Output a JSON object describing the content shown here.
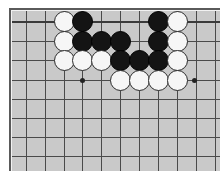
{
  "figure": {
    "kind": "go-board-diagram",
    "width": 220,
    "height": 171
  },
  "colors": {
    "page_background": "#ffffff",
    "board_background": "#c9c9c9",
    "board_frame": "#5a5a5a",
    "grid_line": "#4a4a4a",
    "edge_line": "#3a3a3a",
    "black_stone": "#141414",
    "white_stone": "#f6f6f6",
    "stone_outline": "#2b2b2b",
    "star_point": "#222222"
  },
  "board": {
    "origin_x": 12,
    "origin_y": 11,
    "cell_size": 19.3,
    "surface_width": 208,
    "surface_height": 160,
    "columns": 11,
    "rows": 8,
    "top_edge_visible": true,
    "left_edge_visible": true,
    "column_x": [
      14,
      33,
      52,
      70,
      89,
      108,
      127,
      146,
      165,
      184,
      203
    ],
    "row_y": [
      10,
      30,
      49,
      69,
      88,
      107,
      126,
      145
    ],
    "edge_row_index": 0
  },
  "star_points": [
    {
      "label": "hoshi-left",
      "x": 70,
      "y": 69
    },
    {
      "label": "hoshi-right",
      "x": 182,
      "y": 69
    }
  ],
  "stones": [
    {
      "color": "white",
      "x": 52,
      "y": 10,
      "row": 1,
      "col": 3
    },
    {
      "color": "black",
      "x": 70,
      "y": 10,
      "row": 1,
      "col": 4
    },
    {
      "color": "black",
      "x": 146,
      "y": 10,
      "row": 1,
      "col": 8
    },
    {
      "color": "white",
      "x": 165,
      "y": 10,
      "row": 1,
      "col": 9
    },
    {
      "color": "white",
      "x": 52,
      "y": 30,
      "row": 2,
      "col": 3
    },
    {
      "color": "black",
      "x": 70,
      "y": 30,
      "row": 2,
      "col": 4
    },
    {
      "color": "black",
      "x": 89,
      "y": 30,
      "row": 2,
      "col": 5
    },
    {
      "color": "black",
      "x": 108,
      "y": 30,
      "row": 2,
      "col": 6
    },
    {
      "color": "black",
      "x": 146,
      "y": 30,
      "row": 2,
      "col": 8
    },
    {
      "color": "white",
      "x": 165,
      "y": 30,
      "row": 2,
      "col": 9
    },
    {
      "color": "white",
      "x": 52,
      "y": 49,
      "row": 3,
      "col": 3
    },
    {
      "color": "white",
      "x": 70,
      "y": 49,
      "row": 3,
      "col": 4
    },
    {
      "color": "white",
      "x": 89,
      "y": 49,
      "row": 3,
      "col": 5
    },
    {
      "color": "black",
      "x": 108,
      "y": 49,
      "row": 3,
      "col": 6
    },
    {
      "color": "black",
      "x": 127,
      "y": 49,
      "row": 3,
      "col": 7
    },
    {
      "color": "black",
      "x": 146,
      "y": 49,
      "row": 3,
      "col": 8
    },
    {
      "color": "white",
      "x": 165,
      "y": 49,
      "row": 3,
      "col": 9
    },
    {
      "color": "white",
      "x": 108,
      "y": 69,
      "row": 4,
      "col": 6
    },
    {
      "color": "white",
      "x": 127,
      "y": 69,
      "row": 4,
      "col": 7
    },
    {
      "color": "white",
      "x": 146,
      "y": 69,
      "row": 4,
      "col": 8
    },
    {
      "color": "white",
      "x": 165,
      "y": 69,
      "row": 4,
      "col": 9
    }
  ]
}
